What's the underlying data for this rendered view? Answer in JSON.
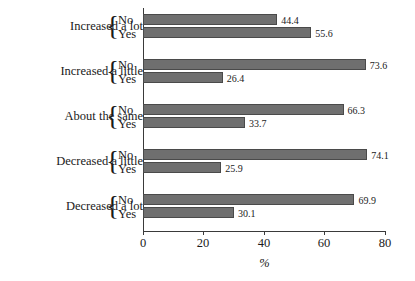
{
  "chart_data": {
    "type": "bar",
    "orientation": "horizontal",
    "title": "",
    "subtitle": "",
    "xlabel": "%",
    "ylabel": "",
    "xlim": [
      0,
      80
    ],
    "xticks": [
      0,
      20,
      40,
      60,
      80
    ],
    "xtick_labels": [
      "0",
      "20",
      "40",
      "60",
      "80"
    ],
    "grid": false,
    "legend": false,
    "legend_position": "none",
    "bar_color": "#6f6f6f",
    "bar_edge_color": "#4a4a4a",
    "axis_color": "#3a3a3a",
    "background_color": "#ffffff",
    "categories": [
      "Increased a lot",
      "Increased a little",
      "About the same",
      "Decreased a little",
      "Decreased a lot"
    ],
    "series": [
      {
        "name": "No",
        "values": [
          44.4,
          73.6,
          66.3,
          74.1,
          69.9
        ]
      },
      {
        "name": "Yes",
        "values": [
          55.6,
          26.4,
          33.7,
          25.9,
          30.1
        ]
      }
    ],
    "groups": [
      {
        "category": "Increased a lot",
        "brace": "{",
        "rows": [
          {
            "series": "No",
            "label": "No",
            "value": 44.4,
            "value_label": "44.4"
          },
          {
            "series": "Yes",
            "label": "Yes",
            "value": 55.6,
            "value_label": "55.6"
          }
        ]
      },
      {
        "category": "Increased a little",
        "brace": "{",
        "rows": [
          {
            "series": "No",
            "label": "No",
            "value": 73.6,
            "value_label": "73.6"
          },
          {
            "series": "Yes",
            "label": "Yes",
            "value": 26.4,
            "value_label": "26.4"
          }
        ]
      },
      {
        "category": "About the same",
        "brace": "{",
        "rows": [
          {
            "series": "No",
            "label": "No",
            "value": 66.3,
            "value_label": "66.3"
          },
          {
            "series": "Yes",
            "label": "Yes",
            "value": 33.7,
            "value_label": "33.7"
          }
        ]
      },
      {
        "category": "Decreased a little",
        "brace": "{",
        "rows": [
          {
            "series": "No",
            "label": "No",
            "value": 74.1,
            "value_label": "74.1"
          },
          {
            "series": "Yes",
            "label": "Yes",
            "value": 25.9,
            "value_label": "25.9"
          }
        ]
      },
      {
        "category": "Decreased a lot",
        "brace": "{",
        "rows": [
          {
            "series": "No",
            "label": "No",
            "value": 69.9,
            "value_label": "69.9"
          },
          {
            "series": "Yes",
            "label": "Yes",
            "value": 30.1,
            "value_label": "30.1"
          }
        ]
      }
    ]
  }
}
